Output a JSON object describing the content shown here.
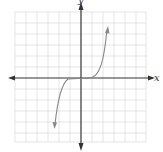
{
  "graph": {
    "x_axis_label": "x",
    "y_axis_label": "y",
    "grid": {
      "cols": 12,
      "rows": 12,
      "color": "#d4d4d4"
    },
    "axis_color": "#333333",
    "curve_color": "#888888",
    "curve_description": "Cubic-like curve: flat near origin over a short interval, rising steeply to upper right and falling steeply to lower left, with arrowheads at both ends"
  }
}
